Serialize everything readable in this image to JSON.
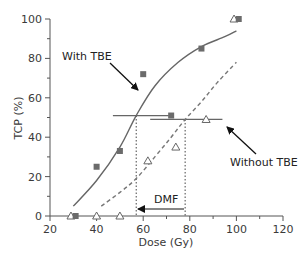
{
  "chart_data": {
    "type": "scatter",
    "title": "",
    "xlabel": "Dose (Gy)",
    "ylabel": "TCP (%)",
    "xlim": [
      20,
      120
    ],
    "ylim": [
      0,
      100
    ],
    "xticks": [
      20,
      40,
      60,
      80,
      100,
      120
    ],
    "yticks": [
      0,
      20,
      40,
      60,
      80,
      100
    ],
    "grid": false,
    "legend": null,
    "series": [
      {
        "name": "With TBE",
        "marker": "square",
        "color": "#666666",
        "points": [
          {
            "x": 31,
            "y": 0
          },
          {
            "x": 40,
            "y": 25
          },
          {
            "x": 50,
            "y": 33
          },
          {
            "x": 60,
            "y": 72
          },
          {
            "x": 72,
            "y": 51
          },
          {
            "x": 85,
            "y": 85
          },
          {
            "x": 101,
            "y": 100
          }
        ],
        "fit_curve": {
          "style": "solid",
          "points": [
            [
              30,
              5
            ],
            [
              40,
              18
            ],
            [
              50,
              35
            ],
            [
              57,
              51
            ],
            [
              65,
              66
            ],
            [
              75,
              78
            ],
            [
              85,
              86
            ],
            [
              95,
              91
            ],
            [
              100,
              94
            ]
          ]
        }
      },
      {
        "name": "Without TBE",
        "marker": "triangle-open",
        "color": "#666666",
        "points": [
          {
            "x": 29,
            "y": 0
          },
          {
            "x": 40,
            "y": 0
          },
          {
            "x": 50,
            "y": 0
          },
          {
            "x": 62,
            "y": 28
          },
          {
            "x": 74,
            "y": 35
          },
          {
            "x": 87,
            "y": 49
          },
          {
            "x": 99,
            "y": 100
          }
        ],
        "fit_curve": {
          "style": "dashed",
          "points": [
            [
              42,
              5
            ],
            [
              50,
              12
            ],
            [
              57,
              19
            ],
            [
              65,
              30
            ],
            [
              72,
              40
            ],
            [
              78,
              49
            ],
            [
              85,
              58
            ],
            [
              92,
              68
            ],
            [
              100,
              78
            ]
          ]
        }
      }
    ],
    "reference_lines": {
      "with_tbe_50": {
        "x_from": 47,
        "x_to": 71,
        "y": 51
      },
      "without_tbe_50": {
        "x_from": 63,
        "x_to": 94,
        "y": 49
      },
      "vertical_with_tbe": {
        "x": 57,
        "y_from": 0,
        "y_to": 51
      },
      "vertical_without_tbe": {
        "x": 78,
        "y_from": 0,
        "y_to": 49
      }
    },
    "annotations": [
      {
        "text": "With TBE",
        "x": 34,
        "y": 78,
        "arrow_to": [
          56,
          62
        ]
      },
      {
        "text": "Without TBE",
        "x": 104,
        "y": 30,
        "arrow_from": [
          104,
          38
        ],
        "arrow_to": [
          93,
          47
        ]
      },
      {
        "text": "DMF",
        "x": 66,
        "y": 8,
        "arrow_from": [
          75,
          3
        ],
        "arrow_to": [
          58,
          3
        ]
      }
    ]
  },
  "labels": {
    "x_axis": "Dose (Gy)",
    "y_axis": "TCP (%)",
    "with_tbe": "With TBE",
    "without_tbe": "Without TBE",
    "dmf": "DMF",
    "xticks": [
      "20",
      "40",
      "60",
      "80",
      "100",
      "120"
    ],
    "yticks": [
      "0",
      "20",
      "40",
      "60",
      "80",
      "100"
    ]
  }
}
